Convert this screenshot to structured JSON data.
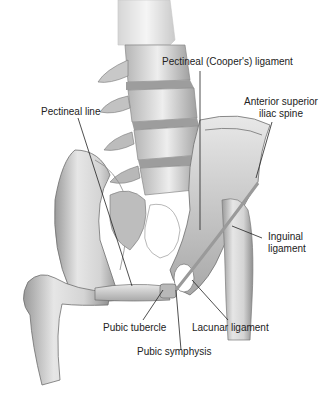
{
  "figure": {
    "labels": {
      "pectineal_ligament": "Pectineal (Cooper's) ligament",
      "pectineal_line": "Pectineal line",
      "asis_line1": "Anterior superior",
      "asis_line2": "iliac spine",
      "inguinal_line1": "Inguinal",
      "inguinal_line2": "ligament",
      "pubic_tubercle": "Pubic tubercle",
      "lacunar_ligament": "Lacunar ligament",
      "pubic_symphysis": "Pubic symphysis"
    },
    "colors": {
      "bone_light": "#ececec",
      "bone_mid": "#c9c9c9",
      "bone_dark": "#8c8c8c",
      "outline": "#6e6e6e",
      "leader": "#222222",
      "text": "#222222"
    }
  }
}
